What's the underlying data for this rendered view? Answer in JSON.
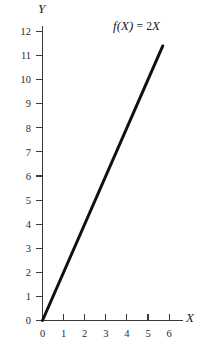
{
  "chart_data": {
    "type": "line",
    "title": "",
    "annotation": "f(X) = 2X",
    "annotation_parts": {
      "f": "f",
      "open": "(",
      "var1": "X",
      "close": ")",
      "equals": "=",
      "coefficient": "2",
      "var2": "X"
    },
    "xlabel": "X",
    "ylabel": "Y",
    "xlim": [
      0,
      6.4
    ],
    "ylim": [
      0,
      12.4
    ],
    "xticks": [
      0,
      1,
      2,
      3,
      4,
      5,
      6
    ],
    "xtick_labels": [
      "0",
      "1",
      "2",
      "3",
      "4",
      "5",
      "6"
    ],
    "yticks": [
      0,
      1,
      2,
      3,
      4,
      5,
      6,
      7,
      8,
      9,
      10,
      11,
      12
    ],
    "ytick_labels": [
      "0",
      "1",
      "2",
      "3",
      "4",
      "5",
      "6",
      "7",
      "8",
      "9",
      "10",
      "11",
      "12"
    ],
    "grid": false,
    "legend": null,
    "series": [
      {
        "name": "f(X) = 2X",
        "slope": 2,
        "intercept": 0,
        "x": [
          0,
          5.7
        ],
        "y": [
          0,
          11.4
        ],
        "color": "#111111",
        "linewidth": 3
      }
    ],
    "background_color": "#ffffff",
    "axis_color": "#3a3a3a",
    "text_color": "#1a1a1a"
  }
}
